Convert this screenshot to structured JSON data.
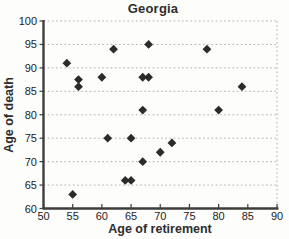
{
  "chart_data": {
    "type": "scatter",
    "title": "Georgia",
    "xlabel": "Age of retirement",
    "ylabel": "Age of death",
    "xlim": [
      50,
      90
    ],
    "ylim": [
      60,
      100
    ],
    "xticks": [
      50,
      55,
      60,
      65,
      70,
      75,
      80,
      85,
      90
    ],
    "yticks": [
      60,
      65,
      70,
      75,
      80,
      85,
      90,
      95,
      100
    ],
    "grid": "horizontal-dotted",
    "legend": "none",
    "marker": "diamond",
    "points": [
      [
        54,
        91
      ],
      [
        55,
        63
      ],
      [
        56,
        87.5
      ],
      [
        56,
        86
      ],
      [
        60,
        88
      ],
      [
        61,
        75
      ],
      [
        62,
        94
      ],
      [
        64,
        66
      ],
      [
        65,
        66
      ],
      [
        65,
        75
      ],
      [
        67,
        70
      ],
      [
        67,
        81
      ],
      [
        67,
        88
      ],
      [
        68,
        88
      ],
      [
        68,
        95
      ],
      [
        70,
        72
      ],
      [
        72,
        74
      ],
      [
        78,
        94
      ],
      [
        80,
        81
      ],
      [
        84,
        86
      ]
    ]
  },
  "colors": {
    "marker": "#2b2b2b",
    "axis": "#3d3d3d",
    "grid": "#aeaeae",
    "tick_text": "#222222",
    "plot_bg": "#fdfdfc"
  }
}
